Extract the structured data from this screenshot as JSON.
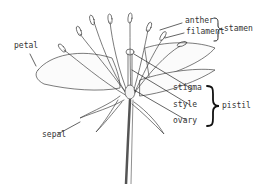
{
  "diagram": {
    "labels": {
      "anther": "anther",
      "filament": "filament",
      "stamen": "stamen",
      "petal": "petal",
      "stigma": "stigma",
      "style": "style",
      "ovary": "ovary",
      "pistil": "pistil",
      "sepal": "sepal"
    },
    "groups": [
      {
        "name": "stamen",
        "members": [
          "anther",
          "filament"
        ]
      },
      {
        "name": "pistil",
        "members": [
          "stigma",
          "style",
          "ovary"
        ]
      }
    ],
    "colors": {
      "ink": "#333333",
      "background": "#ffffff"
    }
  }
}
